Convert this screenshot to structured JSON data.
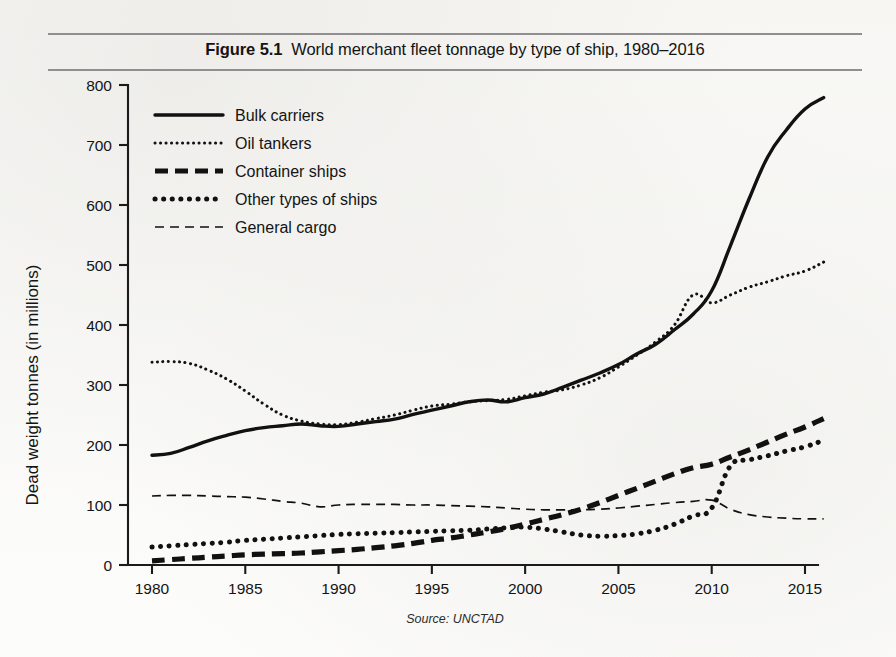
{
  "figure": {
    "label": "Figure 5.1",
    "title": "World merchant fleet tonnage by type of ship, 1980–2016",
    "source": "Source: UNCTAD"
  },
  "chart_data": {
    "type": "line",
    "xlabel": "",
    "ylabel": "Dead weight tonnes (in millions)",
    "xlim": [
      1980,
      2016
    ],
    "ylim": [
      0,
      800
    ],
    "xticks": [
      1980,
      1985,
      1990,
      1995,
      2000,
      2005,
      2010,
      2015
    ],
    "yticks": [
      0,
      100,
      200,
      300,
      400,
      500,
      600,
      700,
      800
    ],
    "xtick_labels": [
      "1980",
      "1985",
      "1990",
      "1995",
      "2000",
      "2005",
      "2010",
      "2015"
    ],
    "ytick_labels": [
      "0",
      "100",
      "200",
      "300",
      "400",
      "500",
      "600",
      "700",
      "800"
    ],
    "grid": false,
    "legend_position": "upper left",
    "x": [
      1980,
      1981,
      1982,
      1983,
      1984,
      1985,
      1986,
      1987,
      1988,
      1989,
      1990,
      1991,
      1992,
      1993,
      1994,
      1995,
      1996,
      1997,
      1998,
      1999,
      2000,
      2001,
      2002,
      2003,
      2004,
      2005,
      2006,
      2007,
      2008,
      2009,
      2010,
      2011,
      2012,
      2013,
      2014,
      2015,
      2016
    ],
    "series": [
      {
        "name": "Bulk carriers",
        "style": "solid",
        "color": "#111111",
        "values": [
          183,
          186,
          196,
          207,
          216,
          224,
          229,
          232,
          235,
          232,
          231,
          235,
          239,
          243,
          251,
          258,
          265,
          272,
          275,
          272,
          279,
          285,
          296,
          308,
          320,
          334,
          352,
          368,
          392,
          418,
          457,
          532,
          610,
          680,
          725,
          760,
          779
        ]
      },
      {
        "name": "Oil tankers",
        "style": "dotted-fine",
        "color": "#111111",
        "values": [
          338,
          339,
          336,
          325,
          310,
          290,
          268,
          250,
          240,
          235,
          234,
          238,
          244,
          250,
          258,
          265,
          268,
          272,
          274,
          276,
          282,
          288,
          292,
          300,
          312,
          330,
          350,
          372,
          400,
          450,
          437,
          450,
          463,
          472,
          482,
          490,
          505
        ]
      },
      {
        "name": "Container ships",
        "style": "dashed-thick",
        "color": "#111111",
        "values": [
          7,
          9,
          11,
          13,
          15,
          17,
          18,
          19,
          20,
          22,
          24,
          26,
          29,
          32,
          36,
          41,
          45,
          50,
          55,
          61,
          68,
          76,
          84,
          93,
          104,
          116,
          128,
          140,
          152,
          162,
          168,
          180,
          192,
          205,
          218,
          230,
          244
        ]
      },
      {
        "name": "Other types of ships",
        "style": "dotted-thick",
        "color": "#111111",
        "values": [
          30,
          32,
          34,
          36,
          38,
          41,
          43,
          45,
          47,
          49,
          51,
          52,
          53,
          54,
          55,
          56,
          57,
          58,
          60,
          62,
          63,
          60,
          55,
          50,
          48,
          49,
          52,
          58,
          68,
          82,
          95,
          165,
          175,
          182,
          190,
          197,
          208
        ]
      },
      {
        "name": "General cargo",
        "style": "dashed-thin",
        "color": "#111111",
        "values": [
          115,
          116,
          116,
          115,
          114,
          113,
          110,
          106,
          103,
          97,
          100,
          101,
          101,
          101,
          100,
          100,
          99,
          98,
          97,
          95,
          93,
          92,
          92,
          92,
          93,
          95,
          98,
          101,
          104,
          106,
          108,
          93,
          84,
          80,
          78,
          77,
          77
        ]
      }
    ]
  },
  "legend": {
    "items": [
      {
        "label": "Bulk carriers",
        "style": "solid"
      },
      {
        "label": "Oil tankers",
        "style": "dotted-fine"
      },
      {
        "label": "Container ships",
        "style": "dashed-thick"
      },
      {
        "label": "Other types of ships",
        "style": "dotted-thick"
      },
      {
        "label": "General cargo",
        "style": "dashed-thin"
      }
    ]
  }
}
